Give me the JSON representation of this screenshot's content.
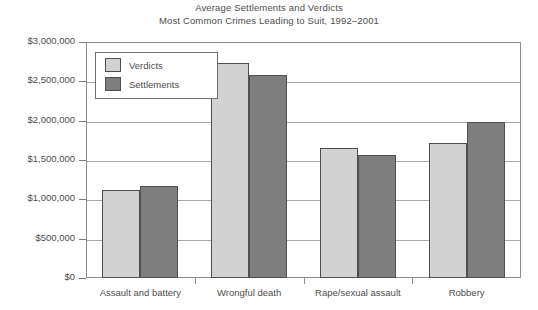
{
  "chart_data": {
    "type": "bar",
    "title": "Average Settlements and Verdicts",
    "subtitle": "Most Common Crimes Leading to Suit, 1992–2001",
    "xlabel": "",
    "ylabel": "",
    "ylim": [
      0,
      3000000
    ],
    "grid": true,
    "legend_position": "top-left inside plot",
    "categories": [
      "Assault and battery",
      "Wrongful death",
      "Rape/sexual assault",
      "Robbery"
    ],
    "series": [
      {
        "name": "Verdicts",
        "color": "#d2d2d2",
        "values": [
          1120000,
          2730000,
          1650000,
          1720000
        ]
      },
      {
        "name": "Settlements",
        "color": "#7e7e7e",
        "values": [
          1170000,
          2580000,
          1560000,
          1980000
        ]
      }
    ],
    "y_ticks": [
      0,
      500000,
      1000000,
      1500000,
      2000000,
      2500000,
      3000000
    ],
    "y_tick_labels": [
      "$0",
      "$500,000",
      "$1,000,000",
      "$1,500,000",
      "$2,000,000",
      "$2,500,000",
      "$3,000,000"
    ]
  },
  "style": {
    "axis_color": "#8c8c8c",
    "grid_color": "#a8a8a8",
    "text_color": "#4d4d4d",
    "bar_border": "#4f4f4f",
    "background": "#ffffff"
  }
}
